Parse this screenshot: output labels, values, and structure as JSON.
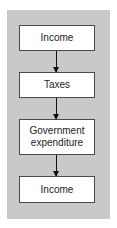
{
  "diagram": {
    "type": "flowchart",
    "direction": "top-to-bottom",
    "nodes": [
      {
        "id": "n1",
        "label": "Income"
      },
      {
        "id": "n2",
        "label": "Taxes"
      },
      {
        "id": "n3",
        "label": "Government\nexpenditure"
      },
      {
        "id": "n4",
        "label": "Income"
      }
    ],
    "edges": [
      {
        "from": "n1",
        "to": "n2"
      },
      {
        "from": "n2",
        "to": "n3"
      },
      {
        "from": "n3",
        "to": "n4"
      }
    ],
    "colors": {
      "background_panel": "#c9c9c9",
      "box_fill": "#ffffff",
      "box_border": "#4a4a4a",
      "arrow": "#111111"
    }
  }
}
